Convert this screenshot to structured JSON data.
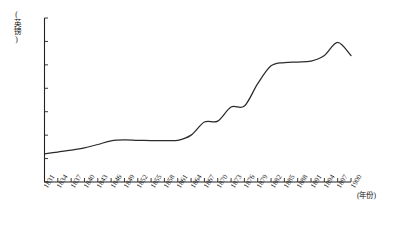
{
  "chart_data": {
    "type": "line",
    "title": "",
    "subtitle": "",
    "xlabel": "(年份)",
    "ylabel": "(英镑)",
    "xlim": [
      1831,
      1900
    ],
    "ylim": [
      0,
      3500
    ],
    "grid": false,
    "legend": null,
    "y_ticks": [
      0,
      500,
      1000,
      1500,
      2000,
      2500,
      3000,
      3500
    ],
    "y_tick_labels": [
      "0",
      "500",
      "1000",
      "1500",
      "2000",
      "2500",
      "3000",
      "3500"
    ],
    "x_ticks": [
      1831,
      1834,
      1837,
      1840,
      1843,
      1846,
      1849,
      1852,
      1855,
      1858,
      1861,
      1864,
      1867,
      1870,
      1873,
      1876,
      1879,
      1882,
      1885,
      1888,
      1891,
      1894,
      1897,
      1900
    ],
    "x_tick_labels": [
      "1831",
      "1834",
      "1837",
      "1840",
      "1843",
      "1846",
      "1849",
      "1852",
      "1855",
      "1858",
      "1861",
      "1864",
      "1867",
      "1870",
      "1873",
      "1876",
      "1879",
      "1882",
      "1885",
      "1888",
      "1891",
      "1894",
      "1897",
      "1900"
    ],
    "series": [
      {
        "name": "",
        "color": "#2b2b2b",
        "x": [
          1831,
          1834,
          1837,
          1840,
          1843,
          1846,
          1849,
          1852,
          1855,
          1858,
          1861,
          1864,
          1867,
          1870,
          1873,
          1876,
          1879,
          1882,
          1885,
          1888,
          1891,
          1894,
          1897,
          1900
        ],
        "values": [
          600,
          640,
          680,
          730,
          800,
          880,
          900,
          890,
          885,
          885,
          890,
          1000,
          1280,
          1300,
          1600,
          1620,
          2100,
          2480,
          2550,
          2560,
          2580,
          2700,
          2980,
          2700
        ]
      }
    ]
  }
}
